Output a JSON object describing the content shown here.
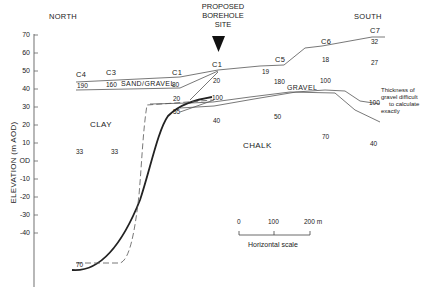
{
  "headers": {
    "north": "NORTH",
    "south": "SOUTH",
    "borehole": [
      "PROPOSED",
      "BOREHOLE",
      "SITE"
    ]
  },
  "y_axis": {
    "label": "ELEVATION (m AOD)",
    "ticks": [
      "70",
      "60",
      "50",
      "40",
      "30",
      "20",
      "10",
      "OD",
      "-10",
      "-20",
      "-30",
      "-40"
    ]
  },
  "boreholes": {
    "c4": "C4",
    "c3": "C3",
    "c1_left": "C1",
    "c1": "C1",
    "c5": "C5",
    "c6": "C6",
    "c7": "C7"
  },
  "values": {
    "c4_190": "190",
    "c3_160": "160",
    "c1l_80": "80",
    "c1l_20": "20",
    "c1l_55": "55",
    "c1_20": "20",
    "c1_100": "100",
    "c1_40": "40",
    "c5_19": "19",
    "c5_180": "180",
    "c5_50": "50",
    "c6_18": "18",
    "c6_100": "100",
    "c6_70": "70",
    "c7_32": "32",
    "c7_27": "27",
    "c7_100": "100",
    "c7_40": "40",
    "clay_33a": "33",
    "clay_33b": "33",
    "bottom_70": "70"
  },
  "units": {
    "sand_gravel": "SAND/GRAVEL",
    "gravel": "GRAVEL",
    "clay": "CLAY",
    "chalk": "CHALK"
  },
  "note": [
    "Thickness of",
    "gravel difficult",
    "to calculate",
    "exactly"
  ],
  "scale": {
    "ticks": [
      "0",
      "100",
      "200 m"
    ],
    "label": "Horizontal scale"
  }
}
